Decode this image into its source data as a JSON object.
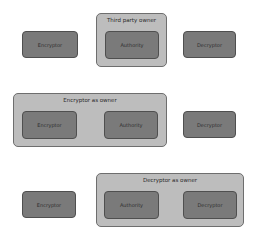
{
  "rows": [
    {
      "encryptor": {
        "label": "Encryptor"
      },
      "container": {
        "title": "Third party owner",
        "authority": {
          "label": "Authority"
        }
      },
      "decryptor": {
        "label": "Decryptor"
      }
    },
    {
      "container": {
        "title": "Encryptor as owner",
        "encryptor": {
          "label": "Encryptor"
        },
        "authority": {
          "label": "Authority"
        }
      },
      "decryptor": {
        "label": "Decryptor"
      }
    },
    {
      "encryptor": {
        "label": "Encryptor"
      },
      "container": {
        "title": "Decryptor as owner",
        "authority": {
          "label": "Authority"
        },
        "decryptor": {
          "label": "Decryptor"
        }
      }
    }
  ],
  "colors": {
    "node_fill": "#7a7a7a",
    "node_border": "#4f4f4f",
    "container_fill": "#bdbdbd",
    "container_border": "#6e6e6e"
  }
}
